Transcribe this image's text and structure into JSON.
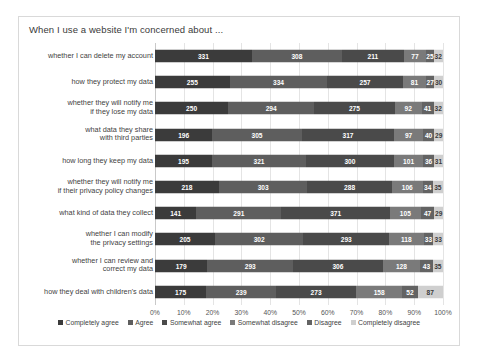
{
  "chart_data": {
    "type": "bar",
    "subtype": "stacked-horizontal-100pct",
    "title": "When I use a website I'm concerned about ...",
    "xlabel": "",
    "ylabel": "",
    "xlim": [
      0,
      100
    ],
    "xunit": "%",
    "grid": true,
    "legend_position": "bottom",
    "xticks": [
      "0%",
      "10%",
      "20%",
      "30%",
      "40%",
      "50%",
      "60%",
      "70%",
      "80%",
      "90%",
      "100%"
    ],
    "categories": [
      "whether I can delete my account",
      "how they protect my data",
      "whether they will notify me\nif they lose my data",
      "what data they share\nwith third parties",
      "how long they keep my data",
      "whether they will notify me\nif their privacy policy changes",
      "what kind of data they collect",
      "whether I can modify\nthe privacy settings",
      "whether I can review and\ncorrect my data",
      "how they deal with children's data"
    ],
    "series": [
      {
        "name": "Completely agree",
        "color": "#3b3b3b",
        "values": [
          331,
          255,
          250,
          196,
          195,
          218,
          141,
          205,
          179,
          175
        ]
      },
      {
        "name": "Agree",
        "color": "#5e5e5e",
        "values": [
          308,
          334,
          294,
          305,
          321,
          303,
          291,
          302,
          293,
          239
        ]
      },
      {
        "name": "Somewhat agree",
        "color": "#4a4a4a",
        "values": [
          211,
          257,
          275,
          317,
          300,
          288,
          371,
          293,
          306,
          273
        ]
      },
      {
        "name": "Somewhat disagree",
        "color": "#7a7a7a",
        "values": [
          77,
          81,
          92,
          97,
          101,
          106,
          105,
          118,
          128,
          158
        ]
      },
      {
        "name": "Disagree",
        "color": "#636363",
        "values": [
          25,
          27,
          41,
          40,
          36,
          34,
          47,
          33,
          43,
          52
        ]
      },
      {
        "name": "Completely disagree",
        "color": "#cfcfcf",
        "values": [
          32,
          30,
          32,
          29,
          31,
          35,
          29,
          33,
          35,
          87
        ]
      }
    ]
  },
  "legend": {
    "items": [
      {
        "label": "Completely agree"
      },
      {
        "label": "Agree"
      },
      {
        "label": "Somewhat agree"
      },
      {
        "label": "Somewhat disagree"
      },
      {
        "label": "Disagree"
      },
      {
        "label": "Completely disagree"
      }
    ]
  }
}
